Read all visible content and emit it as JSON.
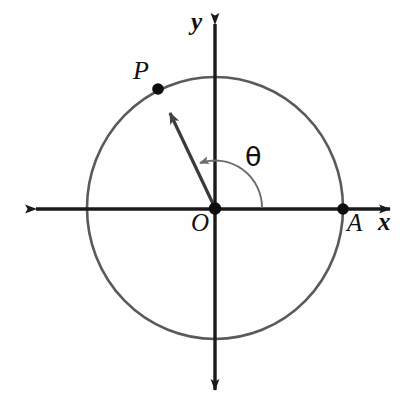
{
  "figure": {
    "type": "unit-circle-angle-diagram",
    "background_color": "#fefefe",
    "ink_color": "#1a1a1a",
    "circle_color": "#5a5a5a",
    "arc_color": "#6b6b6b",
    "width": 418,
    "height": 414
  },
  "labels": {
    "y_axis": "y",
    "x_axis": "x",
    "origin": "O",
    "point_p": "P",
    "point_a": "A",
    "angle": "θ"
  },
  "geometry": {
    "origin": {
      "x": 215,
      "y": 208
    },
    "circle": {
      "cx": 215,
      "cy": 208,
      "rx": 128,
      "ry": 131
    },
    "point_a": {
      "x": 343,
      "y": 209
    },
    "point_p": {
      "x": 158,
      "y": 89
    },
    "angle_arc_radius": 47,
    "x_axis": {
      "x1": 30,
      "x2": 396,
      "y": 209
    },
    "y_axis": {
      "x": 215,
      "y1": 18,
      "y2": 396
    }
  }
}
